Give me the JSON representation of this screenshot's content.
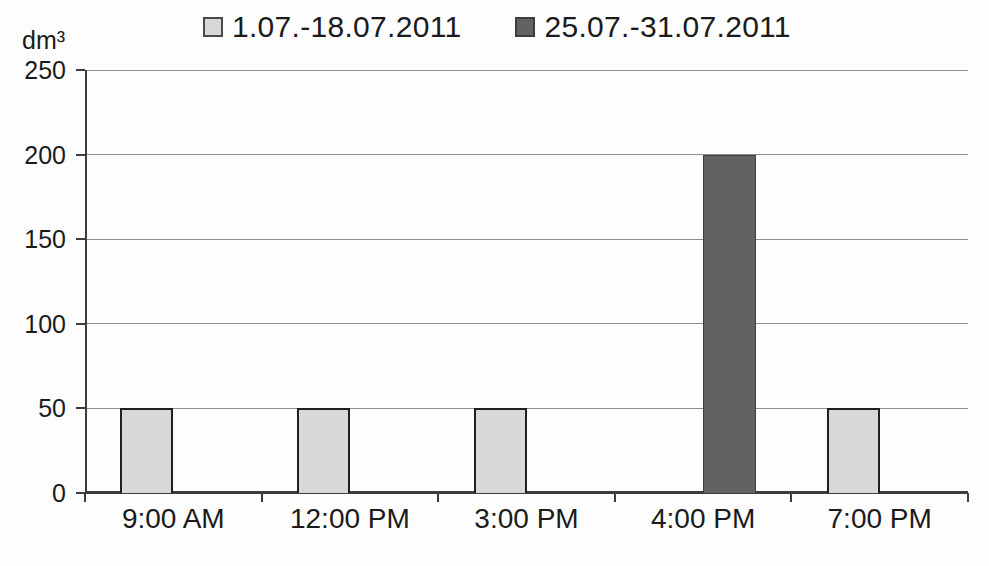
{
  "chart_data": {
    "type": "bar",
    "title": "",
    "xlabel": "",
    "ylabel": "dm³",
    "categories": [
      "9:00 AM",
      "12:00 PM",
      "3:00 PM",
      "4:00 PM",
      "7:00 PM"
    ],
    "series": [
      {
        "name": "1.07.-18.07.2011",
        "color": "#d8d8d8",
        "border": "#1f1f1f",
        "values": [
          50,
          50,
          50,
          null,
          50
        ]
      },
      {
        "name": "25.07.-31.07.2011",
        "color": "#626262",
        "border": "#3e3e3e",
        "values": [
          null,
          null,
          null,
          200,
          null
        ]
      }
    ],
    "ylim": [
      0,
      250
    ],
    "yticks": [
      0,
      50,
      100,
      150,
      200,
      250
    ],
    "grid": true,
    "legend_position": "top",
    "colors": {
      "axis": "#3d3d3d",
      "gridline": "#8f8f8f",
      "text": "#1b1b1b",
      "background": "#fdfdfd"
    }
  }
}
